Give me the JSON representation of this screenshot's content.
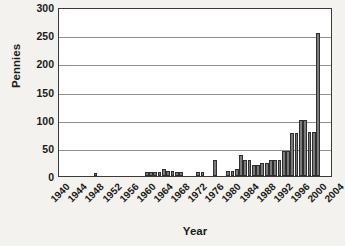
{
  "chart_data": {
    "type": "bar",
    "title": "",
    "xlabel": "Year",
    "ylabel": "Pennies",
    "ylim": [
      0,
      300
    ],
    "yticks": [
      0,
      50,
      100,
      150,
      200,
      250,
      300
    ],
    "xtick_labels": [
      "1940",
      "1944",
      "1948",
      "1952",
      "1956",
      "1960",
      "1964",
      "1968",
      "1972",
      "1976",
      "1980",
      "1984",
      "1988",
      "1992",
      "1996",
      "2000",
      "2004"
    ],
    "xtick_step_years": 4,
    "grid": "horizontal",
    "legend": "none",
    "bar_color": "#7b7b7b",
    "bar_edge_color": "#2e2e2e",
    "plot_background": "#ffffff",
    "figure_background": "#f3f2ee",
    "categories": [
      "1940",
      "1941",
      "1942",
      "1943",
      "1944",
      "1945",
      "1946",
      "1947",
      "1948",
      "1949",
      "1950",
      "1951",
      "1952",
      "1953",
      "1954",
      "1955",
      "1956",
      "1957",
      "1958",
      "1959",
      "1960",
      "1961",
      "1962",
      "1963",
      "1964",
      "1965",
      "1966",
      "1967",
      "1968",
      "1969",
      "1970",
      "1971",
      "1972",
      "1973",
      "1974",
      "1975",
      "1976",
      "1977",
      "1978",
      "1979",
      "1980",
      "1981",
      "1982",
      "1983",
      "1984",
      "1985",
      "1986",
      "1987",
      "1988",
      "1989",
      "1990",
      "1991",
      "1992",
      "1993",
      "1994",
      "1995",
      "1996",
      "1997",
      "1998",
      "1999",
      "2000",
      "2001",
      "2002",
      "2003"
    ],
    "values": [
      0,
      0,
      0,
      0,
      0,
      0,
      0,
      0,
      5,
      0,
      0,
      0,
      0,
      0,
      0,
      0,
      0,
      0,
      0,
      0,
      7,
      7,
      7,
      7,
      13,
      9,
      9,
      7,
      7,
      0,
      0,
      0,
      7,
      7,
      0,
      0,
      28,
      0,
      0,
      9,
      9,
      13,
      38,
      28,
      28,
      19,
      19,
      23,
      23,
      28,
      28,
      28,
      44,
      44,
      76,
      76,
      100,
      100,
      79,
      79,
      254,
      0,
      0,
      0
    ]
  }
}
